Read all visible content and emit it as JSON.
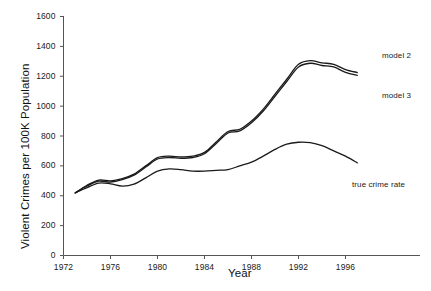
{
  "chart_data": {
    "type": "line",
    "title": "",
    "xlabel": "Year",
    "ylabel": "Violent Crimes per 100K Population",
    "xlim": [
      1972,
      1998
    ],
    "ylim": [
      0,
      1600
    ],
    "grid": false,
    "legend_position": "inline-annotations",
    "xticks": [
      "1972",
      "1976",
      "1980",
      "1984",
      "1988",
      "1992",
      "1996"
    ],
    "xtick_values": [
      1972,
      1976,
      1980,
      1984,
      1988,
      1992,
      1996
    ],
    "yticks": [
      "0",
      "200",
      "400",
      "600",
      "800",
      "1000",
      "1200",
      "1400",
      "1600"
    ],
    "ytick_values": [
      0,
      200,
      400,
      600,
      800,
      1000,
      1200,
      1400,
      1600
    ],
    "x": [
      1973,
      1974,
      1975,
      1976,
      1977,
      1978,
      1979,
      1980,
      1981,
      1982,
      1983,
      1984,
      1985,
      1986,
      1987,
      1988,
      1989,
      1990,
      1991,
      1992,
      1993,
      1994,
      1995,
      1996,
      1997
    ],
    "series": [
      {
        "name": "model 2",
        "label": "model 2",
        "color": "#1a1a1a",
        "values": [
          420,
          470,
          505,
          500,
          515,
          545,
          600,
          655,
          665,
          660,
          665,
          690,
          760,
          830,
          845,
          900,
          980,
          1080,
          1180,
          1280,
          1305,
          1290,
          1280,
          1245,
          1225
        ]
      },
      {
        "name": "model 3",
        "label": "model 3",
        "color": "#1a1a1a",
        "values": [
          418,
          465,
          498,
          492,
          508,
          538,
          592,
          646,
          656,
          651,
          656,
          681,
          750,
          820,
          834,
          888,
          967,
          1066,
          1165,
          1262,
          1287,
          1272,
          1262,
          1226,
          1206
        ]
      },
      {
        "name": "true crime rate",
        "label": "true crime rate",
        "color": "#1a1a1a",
        "values": [
          420,
          455,
          485,
          480,
          465,
          478,
          520,
          565,
          580,
          575,
          565,
          565,
          570,
          575,
          600,
          625,
          665,
          710,
          745,
          758,
          755,
          735,
          700,
          665,
          620
        ]
      }
    ],
    "annotations": [
      {
        "text": "model 2",
        "x_px": 382,
        "y_px": 51
      },
      {
        "text": "model 3",
        "x_px": 382,
        "y_px": 91
      },
      {
        "text": "true crime rate",
        "x_px": 352,
        "y_px": 180
      }
    ]
  },
  "axes": {
    "y_axis_label": "Violent Crimes per 100K Population",
    "x_axis_label": "Year"
  }
}
